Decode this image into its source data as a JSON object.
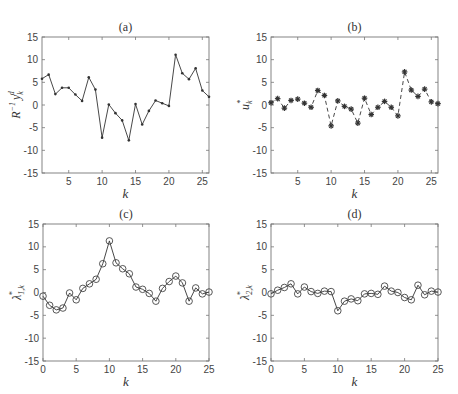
{
  "chart_data": [
    {
      "id": "a",
      "type": "line",
      "title": "(a)",
      "xlabel": "k",
      "ylabel": "R^{-1} y_k^d",
      "ylabel_main": "R",
      "ylabel_sup": "−1",
      "ylabel_var": "y",
      "ylabel_sub": "k",
      "ylabel_sup2": "d",
      "marker": "dot",
      "linestyle": "solid",
      "xlim": [
        1,
        26
      ],
      "ylim": [
        -15,
        15
      ],
      "xticks": [
        5,
        10,
        15,
        20,
        25
      ],
      "yticks": [
        15,
        10,
        5,
        0,
        -5,
        -10,
        -15
      ],
      "x": [
        1,
        2,
        3,
        4,
        5,
        6,
        7,
        8,
        9,
        10,
        11,
        12,
        13,
        14,
        15,
        16,
        17,
        18,
        19,
        20,
        21,
        22,
        23,
        24,
        25,
        26
      ],
      "values": [
        5.8,
        6.7,
        2.4,
        3.8,
        3.8,
        2.3,
        0.9,
        6.1,
        3.4,
        -7.2,
        0.1,
        -1.8,
        -3.4,
        -7.8,
        0.2,
        -4.3,
        -1.3,
        1.0,
        0.4,
        -0.2,
        11.1,
        7.0,
        5.7,
        8.1,
        3.2,
        1.8
      ],
      "grid": false
    },
    {
      "id": "b",
      "type": "line",
      "title": "(b)",
      "xlabel": "k",
      "ylabel": "u_k^*",
      "ylabel_var": "u",
      "ylabel_sub": "k",
      "ylabel_sup": "*",
      "marker": "asterisk",
      "linestyle": "dashed",
      "xlim": [
        1,
        26
      ],
      "ylim": [
        -15,
        15
      ],
      "xticks": [
        5,
        10,
        15,
        20,
        25
      ],
      "yticks": [
        15,
        10,
        5,
        0,
        -5,
        -10,
        -15
      ],
      "x": [
        1,
        2,
        3,
        4,
        5,
        6,
        7,
        8,
        9,
        10,
        11,
        12,
        13,
        14,
        15,
        16,
        17,
        18,
        19,
        20,
        21,
        22,
        23,
        24,
        25,
        26
      ],
      "values": [
        0.5,
        1.4,
        -0.7,
        1.0,
        1.3,
        0.4,
        -0.5,
        3.2,
        2.1,
        -4.6,
        0.9,
        -0.3,
        -0.9,
        -4.0,
        1.5,
        -2.1,
        -0.5,
        0.8,
        -0.5,
        -2.4,
        7.3,
        3.3,
        1.9,
        3.5,
        0.7,
        0.3
      ],
      "grid": false
    },
    {
      "id": "c",
      "type": "line",
      "title": "(c)",
      "xlabel": "k",
      "ylabel": "λ*_{1,k}",
      "ylabel_var": "λ",
      "ylabel_sub": "1,k",
      "ylabel_sup": "*",
      "marker": "circle",
      "linestyle": "solid",
      "xlim": [
        0,
        25
      ],
      "ylim": [
        -15,
        15
      ],
      "xticks": [
        0,
        5,
        10,
        15,
        20,
        25
      ],
      "yticks": [
        15,
        10,
        5,
        0,
        -5,
        -10,
        -15
      ],
      "x": [
        0,
        1,
        2,
        3,
        4,
        5,
        6,
        7,
        8,
        9,
        10,
        11,
        12,
        13,
        14,
        15,
        16,
        17,
        18,
        19,
        20,
        21,
        22,
        23,
        24,
        25
      ],
      "values": [
        -0.8,
        -2.8,
        -3.8,
        -3.4,
        -0.1,
        -1.6,
        0.9,
        1.9,
        2.9,
        6.3,
        11.3,
        6.5,
        5.2,
        4.1,
        1.2,
        0.7,
        -0.2,
        -1.9,
        0.9,
        2.4,
        3.6,
        2.1,
        -1.9,
        1.0,
        -0.3,
        0.1
      ],
      "grid": false
    },
    {
      "id": "d",
      "type": "line",
      "title": "(d)",
      "xlabel": "k",
      "ylabel": "λ*_{2,k}",
      "ylabel_var": "λ",
      "ylabel_sub": "2,k",
      "ylabel_sup": "*",
      "marker": "circle",
      "linestyle": "solid",
      "xlim": [
        0,
        25
      ],
      "ylim": [
        -15,
        15
      ],
      "xticks": [
        0,
        5,
        10,
        15,
        20,
        25
      ],
      "yticks": [
        15,
        10,
        5,
        0,
        -5,
        -10,
        -15
      ],
      "x": [
        0,
        1,
        2,
        3,
        4,
        5,
        6,
        7,
        8,
        9,
        10,
        11,
        12,
        13,
        14,
        15,
        16,
        17,
        18,
        19,
        20,
        21,
        22,
        23,
        24,
        25
      ],
      "values": [
        -0.3,
        0.5,
        1.1,
        1.9,
        -0.3,
        1.2,
        0.2,
        -0.2,
        0.3,
        0.2,
        -4.0,
        -1.9,
        -1.4,
        -1.8,
        -0.3,
        -0.2,
        -0.4,
        1.4,
        0.3,
        0.0,
        -1.1,
        -1.6,
        1.6,
        -0.5,
        0.3,
        0.1
      ],
      "grid": false
    }
  ],
  "layout": {
    "panels": [
      {
        "left": 42,
        "right": 209,
        "top": 37,
        "bottom": 173
      },
      {
        "left": 271,
        "right": 438,
        "top": 37,
        "bottom": 173
      },
      {
        "left": 43,
        "right": 209,
        "top": 224,
        "bottom": 361
      },
      {
        "left": 271,
        "right": 438,
        "top": 224,
        "bottom": 361
      }
    ]
  }
}
